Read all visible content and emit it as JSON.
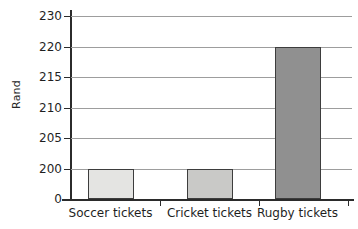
{
  "chart_data": {
    "type": "bar",
    "title": "",
    "subtitle": "",
    "xlabel": "",
    "ylabel": "Rand",
    "categories": [
      "Soccer tickets",
      "Cricket tickets",
      "Rugby tickets"
    ],
    "values": [
      199.4,
      199.7,
      220
    ],
    "series": [
      {
        "name": "Ticket price",
        "values": [
          199.4,
          199.7,
          220
        ]
      }
    ],
    "bar_colors": [
      "#e4e4e2",
      "#c9c9c7",
      "#909090"
    ],
    "bar_edge_color": "#3d3d3d",
    "ytick_labels": [
      "0",
      "200",
      "205",
      "210",
      "215",
      "220",
      "230"
    ],
    "ytick_values": [
      0,
      200,
      205,
      210,
      215,
      220,
      230
    ],
    "axis_note": "broken y-axis: jump from 0 to 200, and uneven 220 to 230 step",
    "ylim": [
      0,
      230
    ],
    "grid": true,
    "grid_color": "#9d9d9d",
    "legend": false,
    "legend_position": "none",
    "axis_color": "#2b2b2b",
    "background": "#ffffff"
  },
  "axes": {
    "y_title": "Rand",
    "ticks": [
      {
        "label": "230",
        "value": 230
      },
      {
        "label": "220",
        "value": 220
      },
      {
        "label": "215",
        "value": 215
      },
      {
        "label": "210",
        "value": 210
      },
      {
        "label": "205",
        "value": 205
      },
      {
        "label": "200",
        "value": 200
      },
      {
        "label": "0",
        "value": 0
      }
    ]
  },
  "bars": [
    {
      "label": "Soccer tickets",
      "value": 199.4,
      "color": "#e4e4e2"
    },
    {
      "label": "Cricket tickets",
      "value": 199.7,
      "color": "#c9c9c7"
    },
    {
      "label": "Rugby tickets",
      "value": 220,
      "color": "#909090"
    }
  ]
}
